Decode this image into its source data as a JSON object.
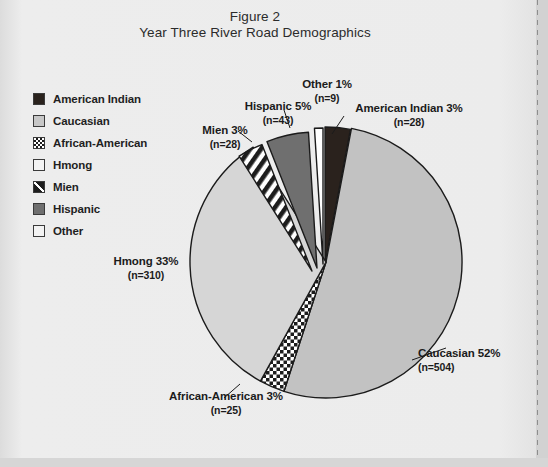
{
  "figure": {
    "title_line1": "Figure 2",
    "title_line2": "Year Three River Road Demographics"
  },
  "legend": {
    "items": [
      {
        "label": "American Indian",
        "swatch": "solid-dark-swatch"
      },
      {
        "label": "Caucasian",
        "swatch": "light-gray-swatch"
      },
      {
        "label": "African-American",
        "swatch": "checker-swatch"
      },
      {
        "label": "Hmong",
        "swatch": "white-swatch"
      },
      {
        "label": "Mien",
        "swatch": "diagonal-swatch"
      },
      {
        "label": "Hispanic",
        "swatch": "mid-gray-swatch"
      },
      {
        "label": "Other",
        "swatch": "white-swatch"
      }
    ]
  },
  "callouts": {
    "other": {
      "main": "Other 1%",
      "sub": "(n=9)"
    },
    "hispanic": {
      "main": "Hispanic 5%",
      "sub": "(n=43)"
    },
    "american_indian": {
      "main": "American Indian 3%",
      "sub": "(n=28)"
    },
    "mien": {
      "main": "Mien 3%",
      "sub": "(n=28)"
    },
    "hmong": {
      "main": "Hmong 33%",
      "sub": "(n=310)"
    },
    "caucasian": {
      "main": "Caucasian 52%",
      "sub": "(n=504)"
    },
    "african_american": {
      "main": "African-American 3%",
      "sub": "(n=25)"
    }
  },
  "chart_data": {
    "type": "pie",
    "total_n": 947,
    "legend_position": "left",
    "start_angle_deg": -90,
    "direction": "clockwise",
    "categories": [
      "American Indian",
      "Caucasian",
      "African-American",
      "Hmong",
      "Mien",
      "Hispanic",
      "Other"
    ],
    "values": [
      3,
      52,
      3,
      33,
      3,
      5,
      1
    ],
    "counts": [
      28,
      504,
      25,
      310,
      28,
      43,
      9
    ],
    "unit": "percent",
    "slices": [
      {
        "label": "American Indian",
        "percent": 3,
        "count": 28,
        "fill": "#2a221d",
        "pattern": "solid"
      },
      {
        "label": "Caucasian",
        "percent": 52,
        "count": 504,
        "fill": "#c2c2c2",
        "pattern": "solid"
      },
      {
        "label": "African-American",
        "percent": 3,
        "count": 25,
        "fill": "#ffffff",
        "pattern": "checker"
      },
      {
        "label": "Hmong",
        "percent": 33,
        "count": 310,
        "fill": "#d6d6d6",
        "pattern": "solid"
      },
      {
        "label": "Mien",
        "percent": 3,
        "count": 28,
        "fill": "#ffffff",
        "pattern": "diagonal-stripe"
      },
      {
        "label": "Hispanic",
        "percent": 5,
        "count": 43,
        "fill": "#6f6f6f",
        "pattern": "solid"
      },
      {
        "label": "Other",
        "percent": 1,
        "count": 9,
        "fill": "#ffffff",
        "pattern": "solid"
      }
    ]
  },
  "colors": {
    "page_background": "#e9e9e9",
    "ink": "#1b1b1b",
    "slice_dark": "#2a221d",
    "slice_light_gray": "#c2c2c2",
    "slice_hmong_gray": "#d6d6d6",
    "slice_mid_gray": "#6f6f6f",
    "slice_white": "#ffffff"
  }
}
